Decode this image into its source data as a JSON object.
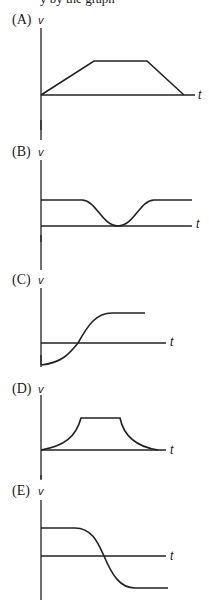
{
  "header": {
    "partial_text": "y   by the graph"
  },
  "options": [
    {
      "label": "(A)",
      "y_axis_label": "v",
      "x_axis_label": "t",
      "shape": "trapezoid: linear rise, constant, linear fall to zero"
    },
    {
      "label": "(B)",
      "y_axis_label": "v",
      "x_axis_label": "t",
      "shape": "constant positive, smooth dip to zero, back to constant"
    },
    {
      "label": "(C)",
      "y_axis_label": "v",
      "x_axis_label": "t",
      "shape": "starts negative, S-curve rising to positive constant"
    },
    {
      "label": "(D)",
      "y_axis_label": "v",
      "x_axis_label": "t",
      "shape": "concave-up rise, constant, concave decay to zero"
    },
    {
      "label": "(E)",
      "y_axis_label": "v",
      "x_axis_label": "t",
      "shape": "constant positive, S-curve falling to negative constant"
    }
  ],
  "colors": {
    "ink": "#222222",
    "background": "#ffffff"
  }
}
